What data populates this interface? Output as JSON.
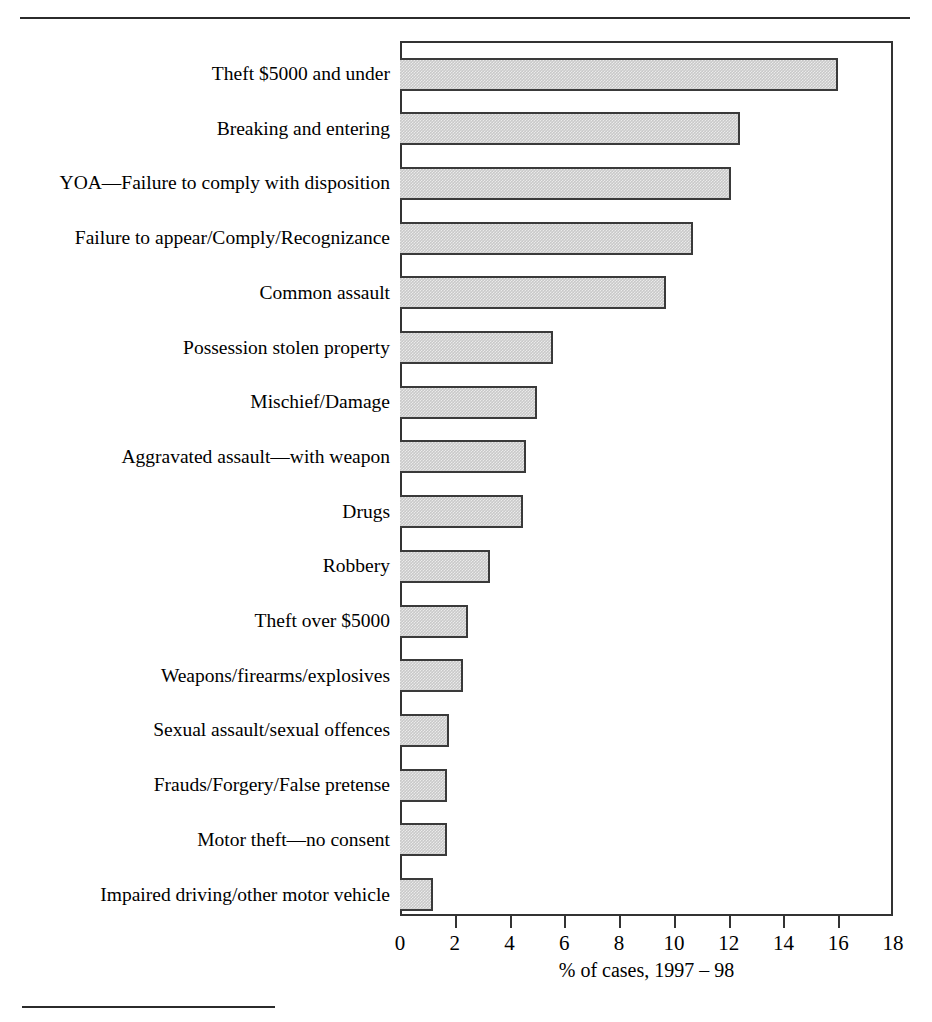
{
  "chart_data": {
    "type": "bar",
    "orientation": "horizontal",
    "title": "",
    "xlabel": "% of cases, 1997 – 98",
    "ylabel": "",
    "xlim": [
      0,
      18
    ],
    "xticks": [
      0,
      2,
      4,
      6,
      8,
      10,
      12,
      14,
      16,
      18
    ],
    "xtick_labels": [
      "0",
      "2",
      "4",
      "6",
      "8",
      "10",
      "12",
      "14",
      "16",
      "18"
    ],
    "grid": false,
    "legend": null,
    "categories": [
      "Theft $5000 and under",
      "Breaking and entering",
      "YOA—Failure to comply with disposition",
      "Failure to appear/Comply/Recognizance",
      "Common assault",
      "Possession stolen property",
      "Mischief/Damage",
      "Aggravated assault—with weapon",
      "Drugs",
      "Robbery",
      "Theft over $5000",
      "Weapons/firearms/explosives",
      "Sexual assault/sexual offences",
      "Frauds/Forgery/False pretense",
      "Motor theft—no consent",
      "Impaired driving/other motor vehicle"
    ],
    "values": [
      16.0,
      12.4,
      12.1,
      10.7,
      9.7,
      5.6,
      5.0,
      4.6,
      4.5,
      3.3,
      2.5,
      2.3,
      1.8,
      1.7,
      1.7,
      1.2
    ],
    "bar_fill_color": "#c9c9c9",
    "bar_edge_color": "#3a3a3a"
  },
  "figure": {
    "rule_color": "#2b2b2b"
  }
}
